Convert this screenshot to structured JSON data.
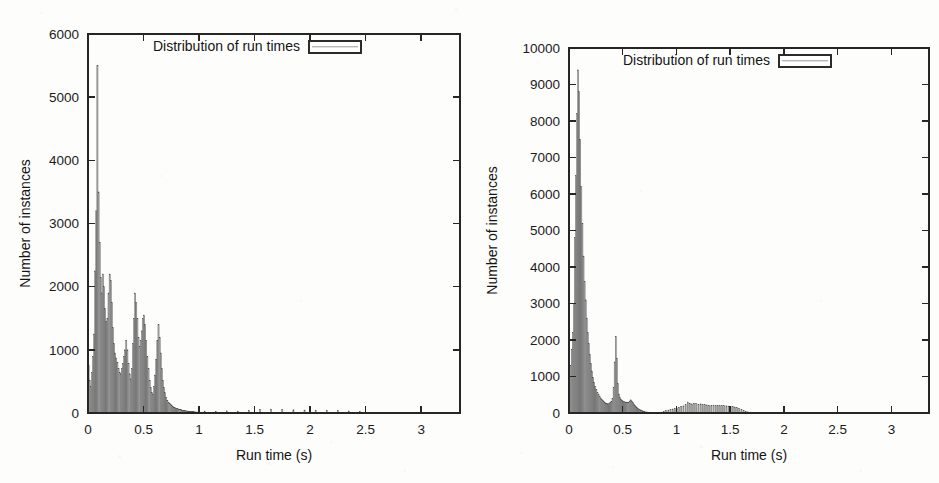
{
  "figure": {
    "background": "#fdfdfc",
    "ink_color": "#1b1b1b",
    "bar_fill": "#b4b4b4",
    "bar_stroke": "#3a3a3a"
  },
  "panels": [
    {
      "id": "left",
      "legend_label": "Distribution of run times",
      "xlabel": "Run time (s)",
      "ylabel": "Number of instances",
      "x_ticks": [
        "0",
        "0.5",
        "1",
        "1.5",
        "2",
        "2.5",
        "3"
      ],
      "y_ticks": [
        "0",
        "1000",
        "2000",
        "3000",
        "4000",
        "5000",
        "6000"
      ]
    },
    {
      "id": "right",
      "legend_label": "Distribution of run times",
      "xlabel": "Run time (s)",
      "ylabel": "Number of instances",
      "x_ticks": [
        "0",
        "0.5",
        "1",
        "1.5",
        "2",
        "2.5",
        "3"
      ],
      "y_ticks": [
        "0",
        "1000",
        "2000",
        "3000",
        "4000",
        "5000",
        "6000",
        "7000",
        "8000",
        "9000",
        "10000"
      ]
    }
  ],
  "chart_data": [
    {
      "type": "bar",
      "id": "left-histogram",
      "title": "",
      "legend": [
        "Distribution of run times"
      ],
      "legend_position": "top-center",
      "grid": false,
      "xlabel": "Run time (s)",
      "ylabel": "Number of instances",
      "xlim": [
        0,
        3.35
      ],
      "ylim": [
        0,
        6000
      ],
      "x_ticks": [
        0,
        0.5,
        1,
        1.5,
        2,
        2.5,
        3
      ],
      "y_ticks": [
        0,
        1000,
        2000,
        3000,
        4000,
        5000,
        6000
      ],
      "bin_width": 0.01,
      "x": [
        0.005,
        0.015,
        0.025,
        0.035,
        0.045,
        0.055,
        0.065,
        0.075,
        0.085,
        0.095,
        0.105,
        0.115,
        0.125,
        0.135,
        0.145,
        0.155,
        0.165,
        0.175,
        0.185,
        0.195,
        0.205,
        0.215,
        0.225,
        0.235,
        0.245,
        0.255,
        0.265,
        0.275,
        0.285,
        0.295,
        0.305,
        0.315,
        0.325,
        0.335,
        0.345,
        0.355,
        0.365,
        0.375,
        0.385,
        0.395,
        0.405,
        0.415,
        0.425,
        0.435,
        0.445,
        0.455,
        0.465,
        0.475,
        0.485,
        0.495,
        0.505,
        0.515,
        0.525,
        0.535,
        0.545,
        0.555,
        0.565,
        0.575,
        0.585,
        0.595,
        0.605,
        0.615,
        0.625,
        0.635,
        0.645,
        0.655,
        0.665,
        0.675,
        0.685,
        0.695,
        0.705,
        0.715,
        0.725,
        0.735,
        0.745,
        0.755,
        0.765,
        0.775,
        0.785,
        0.795,
        0.805,
        0.815,
        0.825,
        0.835,
        0.845,
        0.855,
        0.865,
        0.875,
        0.885,
        0.895,
        0.905,
        0.915,
        0.925,
        0.935,
        0.945,
        0.955,
        0.965,
        0.975,
        0.985,
        0.995,
        1.05,
        1.15,
        1.25,
        1.35,
        1.45,
        1.55,
        1.65,
        1.75,
        1.85,
        1.95,
        2.05,
        2.15,
        2.25,
        2.35,
        2.45,
        2.55,
        2.65,
        2.75,
        2.85,
        2.95,
        3.05,
        3.15,
        3.25
      ],
      "values": [
        760,
        520,
        420,
        640,
        900,
        1250,
        2250,
        3200,
        5500,
        3500,
        2700,
        2150,
        1900,
        2200,
        2000,
        1650,
        1450,
        1500,
        1900,
        2200,
        2100,
        1750,
        1350,
        1100,
        950,
        870,
        800,
        700,
        640,
        620,
        700,
        780,
        900,
        1000,
        1150,
        1000,
        780,
        620,
        540,
        700,
        1100,
        1500,
        1900,
        1750,
        1500,
        1200,
        1050,
        1150,
        1300,
        1500,
        1550,
        1400,
        1150,
        900,
        700,
        520,
        400,
        330,
        300,
        420,
        600,
        850,
        1150,
        1400,
        1200,
        950,
        700,
        520,
        400,
        320,
        250,
        200,
        170,
        150,
        130,
        115,
        100,
        90,
        82,
        75,
        68,
        62,
        56,
        52,
        48,
        44,
        40,
        37,
        34,
        31,
        29,
        26,
        24,
        22,
        20,
        19,
        17,
        16,
        15,
        14,
        30,
        24,
        34,
        30,
        38,
        58,
        62,
        54,
        50,
        46,
        42,
        40,
        36,
        32,
        22,
        12,
        8,
        6,
        5,
        4,
        3,
        2,
        2
      ]
    },
    {
      "type": "bar",
      "id": "right-histogram",
      "title": "",
      "legend": [
        "Distribution of run times"
      ],
      "legend_position": "top-center",
      "grid": false,
      "xlabel": "Run time (s)",
      "ylabel": "Number of instances",
      "xlim": [
        0,
        3.35
      ],
      "ylim": [
        0,
        10000
      ],
      "x_ticks": [
        0,
        0.5,
        1,
        1.5,
        2,
        2.5,
        3
      ],
      "y_ticks": [
        0,
        1000,
        2000,
        3000,
        4000,
        5000,
        6000,
        7000,
        8000,
        9000,
        10000
      ],
      "bin_width": 0.01,
      "x": [
        0.005,
        0.015,
        0.025,
        0.035,
        0.045,
        0.055,
        0.065,
        0.075,
        0.085,
        0.095,
        0.105,
        0.115,
        0.125,
        0.135,
        0.145,
        0.155,
        0.165,
        0.175,
        0.185,
        0.195,
        0.205,
        0.215,
        0.225,
        0.235,
        0.245,
        0.255,
        0.265,
        0.275,
        0.285,
        0.295,
        0.305,
        0.315,
        0.325,
        0.335,
        0.345,
        0.355,
        0.365,
        0.375,
        0.385,
        0.395,
        0.405,
        0.415,
        0.425,
        0.435,
        0.445,
        0.455,
        0.465,
        0.475,
        0.485,
        0.495,
        0.505,
        0.515,
        0.525,
        0.535,
        0.545,
        0.555,
        0.565,
        0.575,
        0.585,
        0.595,
        0.605,
        0.615,
        0.625,
        0.635,
        0.645,
        0.655,
        0.665,
        0.675,
        0.685,
        0.695,
        0.705,
        0.725,
        0.745,
        0.765,
        0.785,
        0.805,
        0.825,
        0.845,
        0.865,
        0.885,
        0.905,
        0.925,
        0.945,
        0.965,
        0.985,
        1.005,
        1.025,
        1.045,
        1.065,
        1.085,
        1.105,
        1.125,
        1.145,
        1.165,
        1.185,
        1.205,
        1.225,
        1.245,
        1.265,
        1.285,
        1.305,
        1.325,
        1.345,
        1.365,
        1.385,
        1.405,
        1.425,
        1.445,
        1.465,
        1.485,
        1.505,
        1.525,
        1.545,
        1.565,
        1.585,
        1.605,
        1.625,
        1.645,
        1.665,
        1.685,
        1.75,
        1.85,
        1.95,
        2.05,
        2.15,
        2.25,
        2.35,
        2.45,
        2.55,
        2.65,
        2.75,
        2.85,
        2.95,
        3.05,
        3.15,
        3.25
      ],
      "values": [
        900,
        1300,
        1750,
        2200,
        3000,
        4800,
        6500,
        8200,
        9400,
        8800,
        7500,
        6200,
        5200,
        4300,
        3600,
        3100,
        2600,
        2200,
        1900,
        1600,
        1350,
        1150,
        980,
        840,
        730,
        640,
        560,
        500,
        450,
        410,
        370,
        340,
        310,
        290,
        270,
        260,
        250,
        260,
        280,
        320,
        400,
        700,
        1400,
        2100,
        1500,
        800,
        520,
        420,
        380,
        350,
        330,
        310,
        300,
        290,
        280,
        300,
        330,
        360,
        330,
        290,
        250,
        210,
        175,
        145,
        120,
        100,
        85,
        70,
        58,
        48,
        40,
        30,
        24,
        20,
        17,
        15,
        14,
        18,
        26,
        40,
        60,
        80,
        95,
        110,
        125,
        140,
        160,
        175,
        195,
        230,
        300,
        270,
        250,
        270,
        260,
        240,
        250,
        230,
        225,
        220,
        215,
        210,
        205,
        215,
        210,
        200,
        205,
        200,
        195,
        190,
        185,
        175,
        165,
        145,
        120,
        95,
        70,
        50,
        32,
        18,
        8,
        5,
        4,
        3,
        3,
        2,
        2,
        2,
        2,
        2,
        2,
        2,
        2,
        1,
        1,
        1
      ]
    }
  ]
}
